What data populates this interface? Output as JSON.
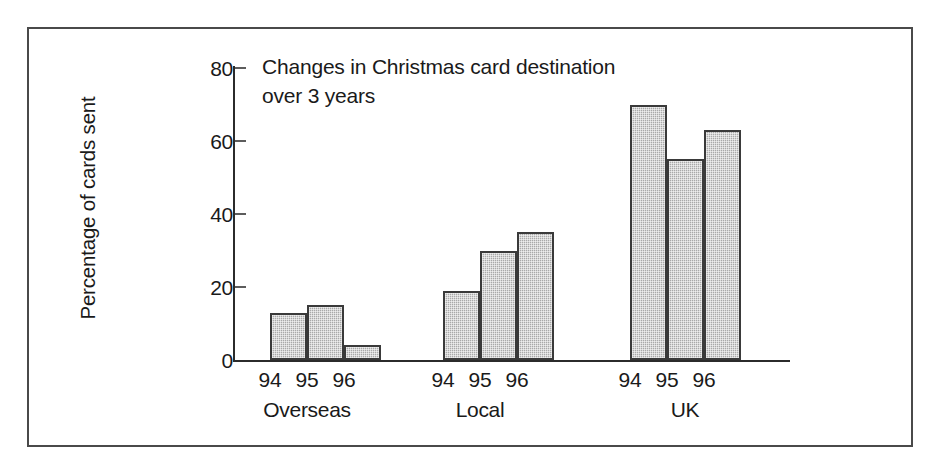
{
  "chart_data": {
    "type": "bar",
    "title": "Changes in Christmas card destination over 3 years",
    "title_lines": [
      "Changes in Christmas card destination",
      "over 3 years"
    ],
    "xlabel": "",
    "ylabel": "Percentage of cards sent",
    "ylim": [
      0,
      80
    ],
    "yticks": [
      0,
      20,
      40,
      60,
      80
    ],
    "ytick_labels": [
      "0",
      "20",
      "40",
      "60",
      "80"
    ],
    "grid": false,
    "legend": "none",
    "categories": [
      "Overseas",
      "Local",
      "UK"
    ],
    "series": [
      {
        "name": "94",
        "values": [
          13,
          19,
          70
        ]
      },
      {
        "name": "95",
        "values": [
          15,
          30,
          55
        ]
      },
      {
        "name": "96",
        "values": [
          4,
          35,
          63
        ]
      }
    ],
    "groups": [
      {
        "label": "Overseas",
        "years": [
          "94",
          "95",
          "96"
        ],
        "values": [
          13,
          15,
          4
        ]
      },
      {
        "label": "Local",
        "years": [
          "94",
          "95",
          "96"
        ],
        "values": [
          19,
          30,
          35
        ]
      },
      {
        "label": "UK",
        "years": [
          "94",
          "95",
          "96"
        ],
        "values": [
          70,
          55,
          63
        ]
      }
    ],
    "colors": {
      "bar_fill": "#a9a9a9",
      "bar_outline": "#3a3a3a",
      "axis": "#2b2b2b",
      "text": "#1a1a1a",
      "frame": "#4a4a4a",
      "background": "#ffffff"
    }
  }
}
